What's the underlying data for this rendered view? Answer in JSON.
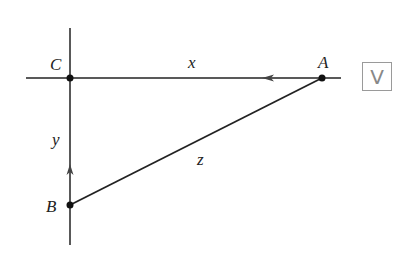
{
  "diagram": {
    "points": {
      "C": {
        "label": "C",
        "x": 70,
        "y": 78
      },
      "A": {
        "label": "A",
        "x": 322,
        "y": 78
      },
      "B": {
        "label": "B",
        "x": 70,
        "y": 205
      }
    },
    "segments": {
      "x": {
        "label": "x",
        "from": "A",
        "to": "C",
        "arrow": "left"
      },
      "y": {
        "label": "y",
        "from": "B",
        "to": "C",
        "arrow": "up"
      },
      "z": {
        "label": "z",
        "from": "B",
        "to": "A"
      }
    },
    "badge": {
      "label": "V",
      "icon": "video-icon"
    },
    "colors": {
      "line": "#222222",
      "badge_border": "#9a9a9a"
    }
  }
}
